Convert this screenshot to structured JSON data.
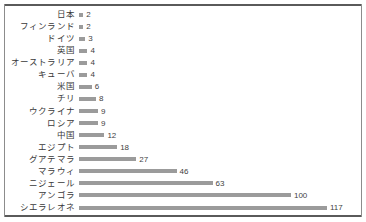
{
  "chart_data": {
    "type": "bar",
    "orientation": "horizontal",
    "title": "",
    "subtitle": "",
    "xlabel": "",
    "ylabel": "",
    "grid": false,
    "legend": false,
    "xlim": [
      0,
      117
    ],
    "value_labels": true,
    "bar_color": "#9b9b9b",
    "label_color": "#3a3a3a",
    "frame_color": "#5a5a5a",
    "categories": [
      "日本",
      "フィンランド",
      "ドイツ",
      "英国",
      "オーストラリア",
      "キューバ",
      "米国",
      "チリ",
      "ウクライナ",
      "ロシア",
      "中国",
      "エジプト",
      "グアテマラ",
      "マラウィ",
      "ニジェール",
      "アンゴラ",
      "シエラレオネ"
    ],
    "values": [
      2,
      2,
      3,
      4,
      4,
      4,
      6,
      8,
      9,
      9,
      12,
      18,
      27,
      46,
      63,
      100,
      117
    ],
    "rows": [
      {
        "label": "日本",
        "value": 2,
        "value_text": "2"
      },
      {
        "label": "フィンランド",
        "value": 2,
        "value_text": "2"
      },
      {
        "label": "ドイツ",
        "value": 3,
        "value_text": "3"
      },
      {
        "label": "英国",
        "value": 4,
        "value_text": "4"
      },
      {
        "label": "オーストラリア",
        "value": 4,
        "value_text": "4"
      },
      {
        "label": "キューバ",
        "value": 4,
        "value_text": "4"
      },
      {
        "label": "米国",
        "value": 6,
        "value_text": "6"
      },
      {
        "label": "チリ",
        "value": 8,
        "value_text": "8"
      },
      {
        "label": "ウクライナ",
        "value": 9,
        "value_text": "9"
      },
      {
        "label": "ロシア",
        "value": 9,
        "value_text": "9"
      },
      {
        "label": "中国",
        "value": 12,
        "value_text": "12"
      },
      {
        "label": "エジプト",
        "value": 18,
        "value_text": "18"
      },
      {
        "label": "グアテマラ",
        "value": 27,
        "value_text": "27"
      },
      {
        "label": "マラウィ",
        "value": 46,
        "value_text": "46"
      },
      {
        "label": "ニジェール",
        "value": 63,
        "value_text": "63"
      },
      {
        "label": "アンゴラ",
        "value": 100,
        "value_text": "100"
      },
      {
        "label": "シエラレオネ",
        "value": 117,
        "value_text": "117"
      }
    ]
  }
}
